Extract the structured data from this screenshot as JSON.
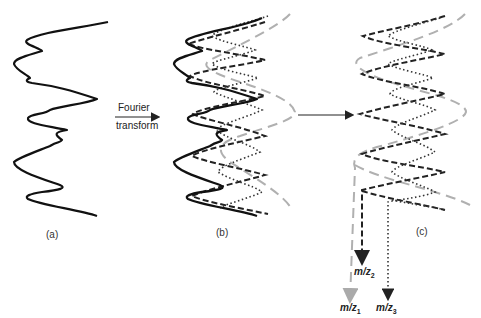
{
  "figure": {
    "panels": [
      {
        "id": "a",
        "label": "(a)",
        "description": "Composite time-domain signal"
      },
      {
        "id": "b",
        "label": "(b)",
        "description": "Composite signal overlaid with its sinusoidal components"
      },
      {
        "id": "c",
        "label": "(c)",
        "description": "Separated sinusoidal components mapped to m/z values"
      }
    ],
    "arrow_1": {
      "line1": "Fourier",
      "line2": "transform"
    },
    "components": [
      {
        "name": "m/z1",
        "base": "m/z",
        "sub": "1",
        "style": "long-dash",
        "color": "#aaaaaa"
      },
      {
        "name": "m/z2",
        "base": "m/z",
        "sub": "2",
        "style": "dashed",
        "color": "#222222"
      },
      {
        "name": "m/z3",
        "base": "m/z",
        "sub": "3",
        "style": "dotted",
        "color": "#333333"
      }
    ],
    "composite_color": "#111111"
  }
}
